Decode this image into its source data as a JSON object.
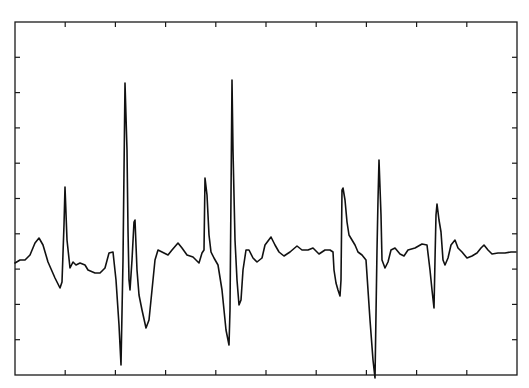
{
  "chart_data": {
    "type": "line",
    "title": "",
    "xlabel": "",
    "ylabel": "",
    "grid": false,
    "legend": null,
    "tick_labels_visible": false,
    "x_ticks_count": 9,
    "y_ticks_count": 9,
    "xlim": [
      0,
      10
    ],
    "ylim": [
      0,
      10
    ],
    "colors": {
      "trace": "#111111",
      "axes": "#1a1a1a",
      "background": "#ffffff"
    },
    "series": [
      {
        "name": "signal",
        "points": [
          [
            15,
            263
          ],
          [
            20,
            260
          ],
          [
            25,
            260
          ],
          [
            30,
            255
          ],
          [
            35,
            243
          ],
          [
            39,
            238
          ],
          [
            43,
            245
          ],
          [
            48,
            262
          ],
          [
            55,
            278
          ],
          [
            60,
            288
          ],
          [
            62,
            282
          ],
          [
            64,
            225
          ],
          [
            65,
            187
          ],
          [
            67,
            240
          ],
          [
            70,
            268
          ],
          [
            73,
            262
          ],
          [
            76,
            265
          ],
          [
            80,
            263
          ],
          [
            85,
            265
          ],
          [
            88,
            270
          ],
          [
            95,
            273
          ],
          [
            100,
            273
          ],
          [
            105,
            268
          ],
          [
            109,
            253
          ],
          [
            113,
            252
          ],
          [
            116,
            280
          ],
          [
            119,
            325
          ],
          [
            121,
            365
          ],
          [
            123,
            260
          ],
          [
            125,
            83
          ],
          [
            127,
            150
          ],
          [
            128,
            230
          ],
          [
            129,
            280
          ],
          [
            130,
            290
          ],
          [
            132,
            260
          ],
          [
            134,
            222
          ],
          [
            135,
            220
          ],
          [
            137,
            270
          ],
          [
            139,
            295
          ],
          [
            142,
            310
          ],
          [
            146,
            328
          ],
          [
            149,
            320
          ],
          [
            152,
            290
          ],
          [
            155,
            260
          ],
          [
            158,
            250
          ],
          [
            162,
            252
          ],
          [
            168,
            255
          ],
          [
            172,
            250
          ],
          [
            178,
            243
          ],
          [
            182,
            248
          ],
          [
            187,
            255
          ],
          [
            193,
            257
          ],
          [
            199,
            263
          ],
          [
            202,
            253
          ],
          [
            204,
            250
          ],
          [
            205,
            178
          ],
          [
            207,
            195
          ],
          [
            209,
            235
          ],
          [
            211,
            252
          ],
          [
            214,
            258
          ],
          [
            218,
            265
          ],
          [
            222,
            290
          ],
          [
            226,
            330
          ],
          [
            229,
            345
          ],
          [
            230,
            310
          ],
          [
            232,
            80
          ],
          [
            233,
            150
          ],
          [
            235,
            240
          ],
          [
            237,
            280
          ],
          [
            239,
            305
          ],
          [
            241,
            300
          ],
          [
            243,
            270
          ],
          [
            246,
            250
          ],
          [
            249,
            250
          ],
          [
            253,
            258
          ],
          [
            257,
            262
          ],
          [
            262,
            258
          ],
          [
            265,
            245
          ],
          [
            271,
            237
          ],
          [
            275,
            245
          ],
          [
            279,
            252
          ],
          [
            284,
            256
          ],
          [
            290,
            252
          ],
          [
            297,
            246
          ],
          [
            302,
            250
          ],
          [
            308,
            250
          ],
          [
            313,
            248
          ],
          [
            319,
            254
          ],
          [
            325,
            250
          ],
          [
            330,
            250
          ],
          [
            333,
            252
          ],
          [
            334,
            270
          ],
          [
            336,
            283
          ],
          [
            338,
            290
          ],
          [
            340,
            296
          ],
          [
            341,
            280
          ],
          [
            342,
            190
          ],
          [
            343,
            188
          ],
          [
            345,
            200
          ],
          [
            347,
            222
          ],
          [
            349,
            235
          ],
          [
            352,
            240
          ],
          [
            355,
            245
          ],
          [
            358,
            252
          ],
          [
            362,
            255
          ],
          [
            366,
            260
          ],
          [
            370,
            320
          ],
          [
            373,
            360
          ],
          [
            375,
            378
          ],
          [
            377,
            250
          ],
          [
            378,
            200
          ],
          [
            379,
            160
          ],
          [
            381,
            215
          ],
          [
            382,
            260
          ],
          [
            385,
            268
          ],
          [
            388,
            262
          ],
          [
            391,
            250
          ],
          [
            395,
            248
          ],
          [
            400,
            254
          ],
          [
            404,
            256
          ],
          [
            408,
            250
          ],
          [
            415,
            248
          ],
          [
            422,
            244
          ],
          [
            427,
            245
          ],
          [
            430,
            270
          ],
          [
            432,
            290
          ],
          [
            434,
            308
          ],
          [
            435,
            260
          ],
          [
            436,
            215
          ],
          [
            437,
            204
          ],
          [
            439,
            220
          ],
          [
            441,
            232
          ],
          [
            443,
            260
          ],
          [
            445,
            265
          ],
          [
            448,
            258
          ],
          [
            451,
            245
          ],
          [
            455,
            240
          ],
          [
            458,
            248
          ],
          [
            462,
            252
          ],
          [
            467,
            258
          ],
          [
            472,
            256
          ],
          [
            477,
            253
          ],
          [
            481,
            248
          ],
          [
            484,
            245
          ],
          [
            488,
            250
          ],
          [
            492,
            254
          ],
          [
            498,
            253
          ],
          [
            505,
            253
          ],
          [
            511,
            252
          ],
          [
            516,
            252
          ]
        ]
      }
    ]
  },
  "plot_area": {
    "left": 15,
    "top": 22,
    "right": 517,
    "bottom": 375
  }
}
